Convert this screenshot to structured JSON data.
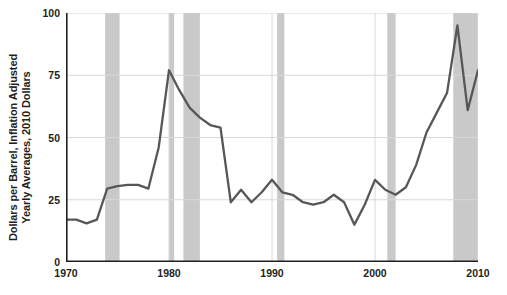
{
  "chart_data": {
    "type": "line",
    "title": "",
    "xlabel": "",
    "ylabel": "Dollars per Barrel, Inflation Adjusted Yearly Averages, 2010 Dollars",
    "ylabel_lines": [
      "Dollars per Barrel, Inflation Adjusted",
      "Yearly Averages, 2010 Dollars"
    ],
    "xlim": [
      1970,
      2010
    ],
    "ylim": [
      0,
      100
    ],
    "y_ticks": [
      0,
      25,
      50,
      75,
      100
    ],
    "y_tick_labels": [
      "0",
      "25",
      "50",
      "75",
      "100"
    ],
    "x_ticks": [
      1970,
      1980,
      1990,
      2000,
      2010
    ],
    "x_tick_labels": [
      "1970",
      "1980",
      "1990",
      "2000",
      "2010"
    ],
    "x_minor_tick_step": 1,
    "grid": "horizontal-and-vertical-at-major-ticks",
    "legend": "none",
    "series": [
      {
        "name": "Crude oil price (2010 dollars per barrel)",
        "color": "#575757",
        "x": [
          1970,
          1971,
          1972,
          1973,
          1974,
          1975,
          1976,
          1977,
          1978,
          1979,
          1980,
          1981,
          1982,
          1983,
          1984,
          1985,
          1986,
          1987,
          1988,
          1989,
          1990,
          1991,
          1992,
          1993,
          1994,
          1995,
          1996,
          1997,
          1998,
          1999,
          2000,
          2001,
          2002,
          2003,
          2004,
          2005,
          2006,
          2007,
          2008,
          2009,
          2010
        ],
        "values": [
          17,
          17,
          15.5,
          17,
          29.5,
          30.5,
          31,
          31,
          29.5,
          46,
          77,
          69,
          62,
          58,
          55,
          54,
          24,
          29,
          24,
          28,
          33,
          28,
          27,
          24,
          23,
          24,
          27,
          24,
          15,
          23,
          33,
          29,
          27,
          30,
          39,
          52,
          60,
          68,
          95,
          61,
          77
        ]
      }
    ],
    "recession_bands": [
      {
        "label": "1973-1975 recession",
        "start": 1973.8,
        "end": 1975.2
      },
      {
        "label": "1980 recession",
        "start": 1980.0,
        "end": 1980.5
      },
      {
        "label": "1981-1982 recession",
        "start": 1981.4,
        "end": 1983.0
      },
      {
        "label": "1990-1991 recession",
        "start": 1990.5,
        "end": 1991.2
      },
      {
        "label": "2001 recession",
        "start": 2001.2,
        "end": 2002.0
      },
      {
        "label": "2007-2009 recession",
        "start": 2007.6,
        "end": 2010.0
      }
    ],
    "colors": {
      "line": "#575757",
      "recession_band": "#c9c9c9",
      "grid": "#d8d8d8",
      "axis": "#231f20",
      "background": "#ffffff",
      "text": "#231f20"
    }
  }
}
